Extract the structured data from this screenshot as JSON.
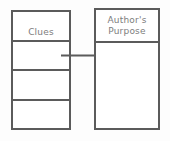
{
  "diagram": {
    "type": "flow-organizer",
    "background_color": "#fdfdfd",
    "line_color": "#5b5b5b",
    "text_color": "#7d7d7d"
  },
  "clues_table": {
    "header_label": "Clues",
    "row_count": 4,
    "rows": [
      {
        "label": "Clues",
        "is_header": true,
        "text": ""
      },
      {
        "label": "",
        "is_header": false,
        "text": ""
      },
      {
        "label": "",
        "is_header": false,
        "text": ""
      },
      {
        "label": "",
        "is_header": false,
        "text": ""
      }
    ]
  },
  "purpose_box": {
    "header_label": "Author's\nPurpose",
    "header_line_1": "Author's",
    "header_line_2": "Purpose",
    "body_text": ""
  },
  "connector": {
    "name": "arrow",
    "direction": "right",
    "from": "clues-table",
    "to": "purpose-box",
    "color": "#5b5b5b"
  }
}
